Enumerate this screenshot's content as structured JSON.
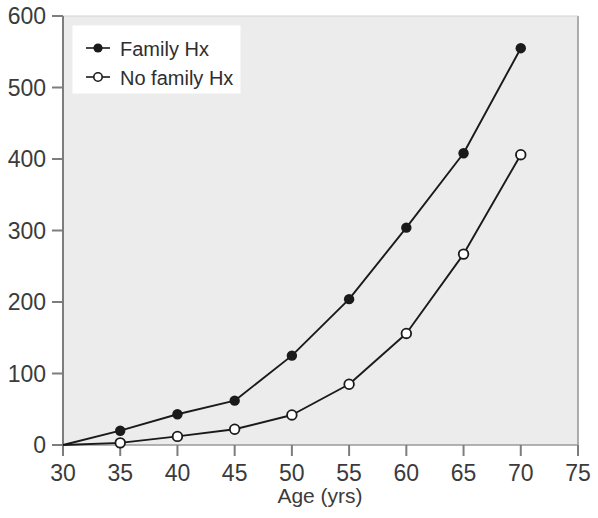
{
  "chart_data": {
    "type": "line",
    "title": "",
    "subtitle": "",
    "xlabel": "Age (yrs)",
    "ylabel": "",
    "x": [
      30,
      35,
      40,
      45,
      50,
      55,
      60,
      65,
      70
    ],
    "xlim": [
      30,
      75
    ],
    "ylim": [
      0,
      600
    ],
    "xticks": [
      30,
      35,
      40,
      45,
      50,
      55,
      60,
      65,
      70,
      75
    ],
    "yticks": [
      0,
      100,
      200,
      300,
      400,
      500,
      600
    ],
    "xtick_labels": [
      "30",
      "35",
      "40",
      "45",
      "50",
      "55",
      "60",
      "65",
      "70",
      "75"
    ],
    "ytick_labels": [
      "0",
      "100",
      "200",
      "300",
      "400",
      "500",
      "600"
    ],
    "grid": false,
    "legend_position": "top-left",
    "plot_background": "#ececec",
    "series": [
      {
        "name": "Family Hx",
        "marker": "filled-circle",
        "color": "#1a1a1a",
        "values": [
          0,
          20,
          43,
          62,
          125,
          204,
          304,
          408,
          555
        ]
      },
      {
        "name": "No family Hx",
        "marker": "open-circle",
        "color": "#1a1a1a",
        "values": [
          0,
          3,
          12,
          22,
          42,
          85,
          156,
          267,
          406
        ]
      }
    ]
  },
  "legend": {
    "entries": [
      {
        "label": "Family Hx",
        "marker": "filled-circle"
      },
      {
        "label": "No family Hx",
        "marker": "open-circle"
      }
    ]
  },
  "axes": {
    "x_title": "Age (yrs)"
  },
  "colors": {
    "line": "#1a1a1a",
    "plot_bg": "#ececec",
    "page_bg": "#ffffff",
    "text": "#3b3b3b",
    "axis": "#8a8a8a"
  }
}
